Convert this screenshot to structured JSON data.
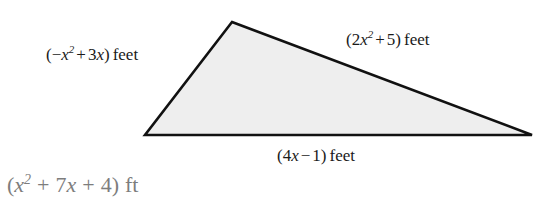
{
  "figure": {
    "shape": "triangle",
    "fill_color": "#eeeeee",
    "stroke_color": "#111111",
    "background_color": "#ffffff",
    "vertices": {
      "apex": [
        232,
        22
      ],
      "bottom_left": [
        145,
        135
      ],
      "bottom_right": [
        532,
        135
      ]
    }
  },
  "labels": {
    "left_side": {
      "open_paren": "(",
      "sign": "−",
      "var1": "x",
      "exp1": "2",
      "op1": "+",
      "coef2": "3",
      "var2": "x",
      "close_paren": ")",
      "unit": "feet",
      "full_text": "(−x2 + 3x) feet"
    },
    "right_side": {
      "open_paren": "(",
      "coef1": "2",
      "var1": "x",
      "exp1": "2",
      "op1": "+",
      "const": "5",
      "close_paren": ")",
      "unit": "feet",
      "full_text": "(2x2 + 5) feet"
    },
    "bottom_side": {
      "open_paren": "(",
      "coef1": "4",
      "var1": "x",
      "op1": "−",
      "const": "1",
      "close_paren": ")",
      "unit": "feet",
      "full_text": "(4x − 1) feet"
    }
  },
  "answer": {
    "open_paren": "(",
    "var1": "x",
    "exp1": "2",
    "op1": "+",
    "coef2": "7",
    "var2": "x",
    "op2": "+",
    "const": "4",
    "close_paren": ")",
    "unit": "ft",
    "full_text": "(x2 + 7x + 4) ft",
    "color": "#7d7d7d"
  }
}
